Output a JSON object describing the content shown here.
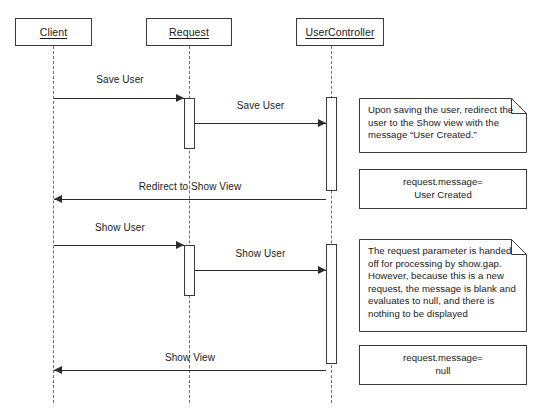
{
  "diagram": {
    "type": "uml-sequence-diagram",
    "title": "",
    "lifelines": [
      {
        "name": "Client",
        "label": "Client",
        "x": 53,
        "box": {
          "x": 15,
          "y": 18,
          "w": 77,
          "h": 28
        }
      },
      {
        "name": "Request",
        "label": "Request",
        "x": 189,
        "box": {
          "x": 146,
          "y": 18,
          "w": 86,
          "h": 28
        }
      },
      {
        "name": "UserController",
        "label": "UserController",
        "x": 331,
        "box": {
          "x": 296,
          "y": 18,
          "w": 88,
          "h": 28
        }
      }
    ],
    "messages": [
      {
        "label": "Save User",
        "from": "Client",
        "to": "Request",
        "direction": "right"
      },
      {
        "label": "Save User",
        "from": "Request",
        "to": "UserController",
        "direction": "right"
      },
      {
        "label": "Redirect to Show View",
        "from": "UserController",
        "to": "Client",
        "direction": "left"
      },
      {
        "label": "Show User",
        "from": "Client",
        "to": "Request",
        "direction": "right"
      },
      {
        "label": "Show User",
        "from": "Request",
        "to": "UserController",
        "direction": "right"
      },
      {
        "label": "Show View",
        "from": "UserController",
        "to": "Client",
        "direction": "left"
      }
    ],
    "notes": [
      {
        "style": "folded",
        "align": "left",
        "lines": [
          "Upon saving the user, redirect the",
          "user to the Show view with the",
          "message “User Created.”"
        ]
      },
      {
        "style": "plain",
        "align": "center",
        "lines": [
          "request.message=",
          "User Created"
        ]
      },
      {
        "style": "folded",
        "align": "left",
        "lines": [
          "The request parameter is handed",
          "off for processing by show.gap.",
          "However, because this is a new",
          "request, the message is blank and",
          "evaluates to null, and there is",
          "nothing to be displayed"
        ]
      },
      {
        "style": "plain",
        "align": "center",
        "lines": [
          "request.message=",
          "null"
        ]
      }
    ],
    "colors": {
      "background": "#ffffff",
      "stroke": "#3a3a3a",
      "arrow": "#2b2b2b",
      "lifeline": "#6e6e6e",
      "text": "#1a1a1a"
    }
  }
}
